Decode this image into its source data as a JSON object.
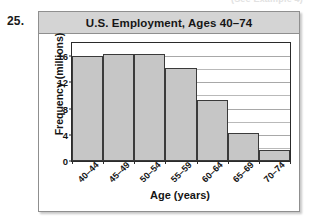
{
  "exercise": {
    "number": "25."
  },
  "page_bleed": {
    "cut_text": "(See Example 4)"
  },
  "chart_data": {
    "type": "bar",
    "title": "U.S. Employment, Ages 40–74",
    "xlabel": "Age (years)",
    "ylabel": "Frequency (millions)",
    "categories": [
      "40–44",
      "45–49",
      "50–54",
      "55–59",
      "60–64",
      "65–69",
      "70–74"
    ],
    "values": [
      16.0,
      16.3,
      16.4,
      14.2,
      9.3,
      4.2,
      1.7
    ],
    "ylim": [
      0,
      18
    ],
    "yticks": [
      0,
      4,
      8,
      12,
      16
    ],
    "ytick_labels": [
      "0",
      "4",
      "8",
      "12",
      "16"
    ],
    "minor_gridline_step": 2,
    "grid": true,
    "legend": false,
    "bar_fill_color": "#c6c6c6",
    "bar_edge_color": "#3a3a3a",
    "title_bar_color": "#d4d4d4"
  }
}
